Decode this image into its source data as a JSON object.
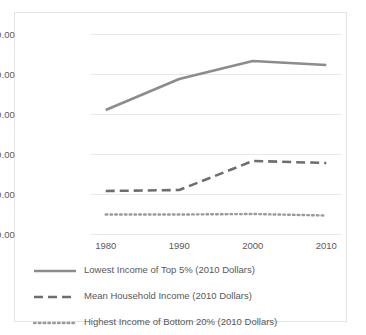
{
  "chart_data": {
    "type": "line",
    "title": "",
    "subtitle": "",
    "xlabel": "",
    "ylabel": "",
    "x": [
      1980,
      1990,
      2000,
      2010
    ],
    "xtick_labels": [
      "1980",
      "1990",
      "2000",
      "2010"
    ],
    "ytick_labels": [
      "$200,000.00",
      "$160,000.00",
      "$120,000.00",
      "$80,000.00",
      "$40,000.00",
      "$0.00"
    ],
    "ytick_values": [
      200000,
      160000,
      120000,
      80000,
      40000,
      0
    ],
    "ylim": [
      0,
      200000
    ],
    "xlim": [
      1978,
      2012
    ],
    "grid": true,
    "legend_position": "bottom",
    "series": [
      {
        "name": "Lowest Income of Top 5% (2010 Dollars)",
        "style": "solid",
        "color": "#8c8c8c",
        "values": [
          124000,
          155000,
          173000,
          169000
        ]
      },
      {
        "name": "Mean Household Income (2010 Dollars)",
        "style": "dashed",
        "color": "#6e6e6e",
        "values": [
          43000,
          44000,
          73000,
          71000
        ]
      },
      {
        "name": "Highest Income of Bottom 20% (2010 Dollars)",
        "style": "dotted",
        "color": "#9a9a9a",
        "values": [
          19500,
          19500,
          20000,
          18500
        ]
      }
    ]
  },
  "legend": {
    "items": [
      {
        "label": "Lowest Income of Top 5% (2010 Dollars)",
        "style": "solid",
        "color": "#8c8c8c"
      },
      {
        "label": "Mean Household Income (2010 Dollars)",
        "style": "dashed",
        "color": "#6e6e6e"
      },
      {
        "label": "Highest Income of Bottom 20% (2010 Dollars)",
        "style": "dotted",
        "color": "#9a9a9a"
      }
    ]
  },
  "axes": {
    "y_labels": [
      "$200,000.00",
      "$160,000.00",
      "$120,000.00",
      "$80,000.00",
      "$40,000.00",
      "$0.00"
    ],
    "x_labels": [
      "1980",
      "1990",
      "2000",
      "2010"
    ]
  },
  "colors": {
    "grid": "#e8e8e8",
    "border": "#e4e4e4",
    "text": "#5a5a5a",
    "background": "#ffffff"
  }
}
